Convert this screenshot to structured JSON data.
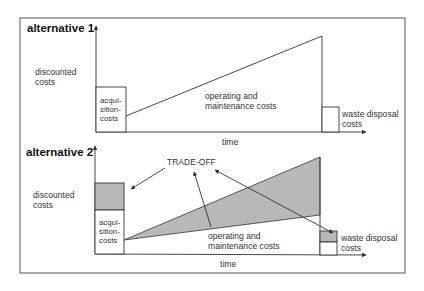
{
  "diagram": {
    "type": "life-cycle cost comparison",
    "colors": {
      "line": "#333333",
      "shade": "#b8b8b8",
      "frame": "#555555",
      "background": "#ffffff"
    },
    "alternative_1": {
      "title": "alternative 1",
      "y_axis_label_line1": "discounted",
      "y_axis_label_line2": "costs",
      "x_axis_label": "time",
      "acquisition_label_line1": "acqui-",
      "acquisition_label_line2": "sition-",
      "acquisition_label_line3": "costs",
      "om_label_line1": "operating and",
      "om_label_line2": "maintenance costs",
      "waste_label_line1": "waste disposal",
      "waste_label_line2": "costs"
    },
    "alternative_2": {
      "title": "alternative 2",
      "y_axis_label_line1": "discounted",
      "y_axis_label_line2": "costs",
      "x_axis_label": "time",
      "acquisition_label_line1": "acqui-",
      "acquisition_label_line2": "sition-",
      "acquisition_label_line3": "costs",
      "om_label_line1": "operating and",
      "om_label_line2": "maintenance costs",
      "waste_label_line1": "waste disposal",
      "waste_label_line2": "costs",
      "tradeoff_label": "TRADE-OFF"
    }
  }
}
